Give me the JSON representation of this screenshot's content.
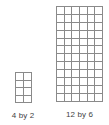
{
  "figure": {
    "background_color": "#ffffff",
    "grid_line_color": "#8a8a8a",
    "caption_color": "#3f3f3f",
    "rectangles": [
      {
        "id": "left",
        "caption": "4 by 2",
        "rows": 4,
        "columns": 2,
        "total_cells": 8
      },
      {
        "id": "right",
        "caption": "12 by 6",
        "rows": 12,
        "columns": 6,
        "total_cells": 72
      }
    ]
  }
}
